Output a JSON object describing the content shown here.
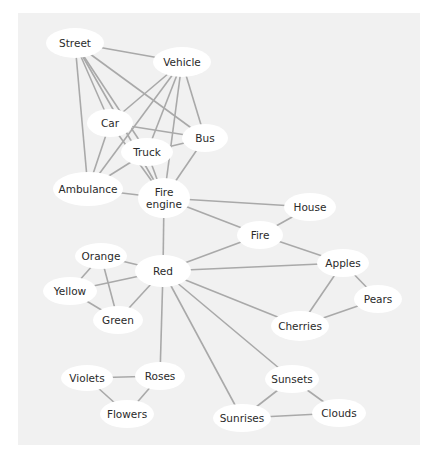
{
  "diagram": {
    "type": "concept-association-network",
    "background": "#f1f1f1",
    "edge_color": "#a9a9a9",
    "node_fill": "#ffffff",
    "nodes": [
      {
        "id": "street",
        "label": "Street",
        "x": 75,
        "y": 43,
        "w": 58,
        "h": 30
      },
      {
        "id": "vehicle",
        "label": "Vehicle",
        "x": 182,
        "y": 62,
        "w": 58,
        "h": 30
      },
      {
        "id": "car",
        "label": "Car",
        "x": 110,
        "y": 123,
        "w": 46,
        "h": 28
      },
      {
        "id": "bus",
        "label": "Bus",
        "x": 205,
        "y": 138,
        "w": 46,
        "h": 28
      },
      {
        "id": "truck",
        "label": "Truck",
        "x": 147,
        "y": 152,
        "w": 52,
        "h": 28
      },
      {
        "id": "ambulance",
        "label": "Ambulance",
        "x": 88,
        "y": 189,
        "w": 70,
        "h": 34
      },
      {
        "id": "fire-engine",
        "label": "Fire\nengine",
        "x": 164,
        "y": 198,
        "w": 52,
        "h": 40
      },
      {
        "id": "house",
        "label": "House",
        "x": 310,
        "y": 207,
        "w": 52,
        "h": 28
      },
      {
        "id": "fire",
        "label": "Fire",
        "x": 260,
        "y": 235,
        "w": 46,
        "h": 28
      },
      {
        "id": "orange",
        "label": "Orange",
        "x": 101,
        "y": 256,
        "w": 52,
        "h": 26
      },
      {
        "id": "red",
        "label": "Red",
        "x": 163,
        "y": 271,
        "w": 56,
        "h": 32
      },
      {
        "id": "apples",
        "label": "Apples",
        "x": 343,
        "y": 263,
        "w": 52,
        "h": 28
      },
      {
        "id": "yellow",
        "label": "Yellow",
        "x": 70,
        "y": 291,
        "w": 54,
        "h": 28
      },
      {
        "id": "pears",
        "label": "Pears",
        "x": 378,
        "y": 299,
        "w": 48,
        "h": 28
      },
      {
        "id": "green",
        "label": "Green",
        "x": 118,
        "y": 320,
        "w": 50,
        "h": 28
      },
      {
        "id": "cherries",
        "label": "Cherries",
        "x": 300,
        "y": 326,
        "w": 58,
        "h": 30
      },
      {
        "id": "violets",
        "label": "Violets",
        "x": 87,
        "y": 378,
        "w": 52,
        "h": 26
      },
      {
        "id": "roses",
        "label": "Roses",
        "x": 160,
        "y": 376,
        "w": 50,
        "h": 28
      },
      {
        "id": "sunsets",
        "label": "Sunsets",
        "x": 292,
        "y": 379,
        "w": 54,
        "h": 28
      },
      {
        "id": "flowers",
        "label": "Flowers",
        "x": 127,
        "y": 414,
        "w": 54,
        "h": 28
      },
      {
        "id": "sunrises",
        "label": "Sunrises",
        "x": 242,
        "y": 418,
        "w": 58,
        "h": 28
      },
      {
        "id": "clouds",
        "label": "Clouds",
        "x": 339,
        "y": 413,
        "w": 54,
        "h": 28
      }
    ],
    "edges": [
      [
        "street",
        "vehicle"
      ],
      [
        "street",
        "ambulance"
      ],
      [
        "street",
        "fire-engine"
      ],
      [
        "street",
        "car"
      ],
      [
        "street",
        "truck"
      ],
      [
        "street",
        "bus"
      ],
      [
        "vehicle",
        "car"
      ],
      [
        "vehicle",
        "ambulance"
      ],
      [
        "vehicle",
        "truck"
      ],
      [
        "vehicle",
        "fire-engine"
      ],
      [
        "vehicle",
        "bus"
      ],
      [
        "car",
        "bus"
      ],
      [
        "car",
        "ambulance"
      ],
      [
        "car",
        "fire-engine"
      ],
      [
        "truck",
        "ambulance"
      ],
      [
        "truck",
        "bus"
      ],
      [
        "truck",
        "fire-engine"
      ],
      [
        "bus",
        "fire-engine"
      ],
      [
        "ambulance",
        "fire-engine"
      ],
      [
        "fire-engine",
        "house"
      ],
      [
        "fire-engine",
        "fire"
      ],
      [
        "fire-engine",
        "red"
      ],
      [
        "fire",
        "house"
      ],
      [
        "fire",
        "apples"
      ],
      [
        "fire",
        "red"
      ],
      [
        "red",
        "orange"
      ],
      [
        "red",
        "yellow"
      ],
      [
        "red",
        "green"
      ],
      [
        "red",
        "apples"
      ],
      [
        "red",
        "cherries"
      ],
      [
        "red",
        "roses"
      ],
      [
        "red",
        "sunsets"
      ],
      [
        "red",
        "sunrises"
      ],
      [
        "orange",
        "yellow"
      ],
      [
        "orange",
        "green"
      ],
      [
        "yellow",
        "green"
      ],
      [
        "apples",
        "pears"
      ],
      [
        "apples",
        "cherries"
      ],
      [
        "pears",
        "cherries"
      ],
      [
        "violets",
        "roses"
      ],
      [
        "violets",
        "flowers"
      ],
      [
        "roses",
        "flowers"
      ],
      [
        "sunsets",
        "sunrises"
      ],
      [
        "sunsets",
        "clouds"
      ],
      [
        "sunrises",
        "clouds"
      ]
    ]
  }
}
